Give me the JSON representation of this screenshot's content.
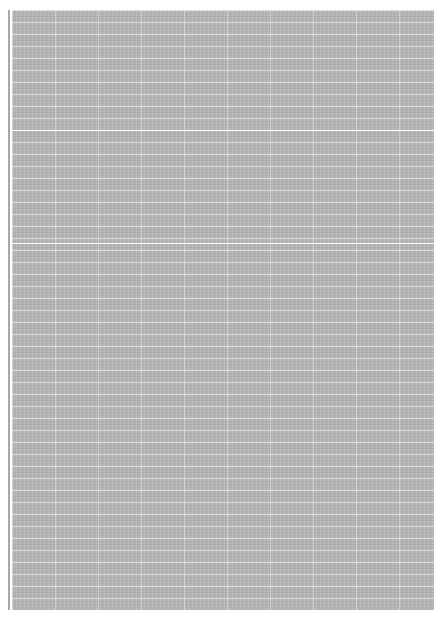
{
  "image": {
    "subject": "grid-paper-sheet",
    "colors": {
      "paper": "#b3b3b3",
      "grid_lines": "#ffffff",
      "background": "#ffffff"
    },
    "major_lines_y": [
      130,
      243
    ]
  }
}
